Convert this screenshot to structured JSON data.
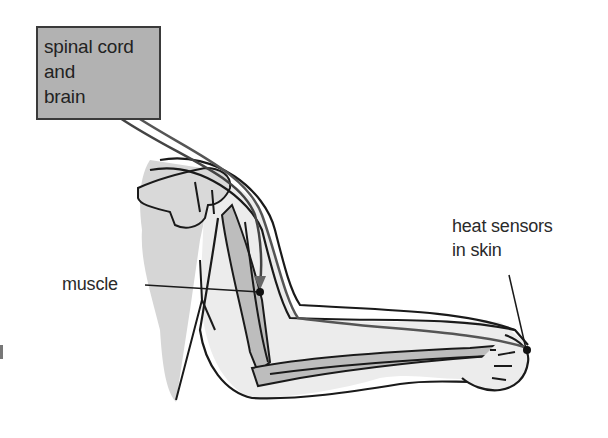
{
  "diagram": {
    "type": "reflex arc",
    "labels": {
      "brain_box": "spinal cord\nand\nbrain",
      "muscle": "muscle",
      "sensor": "heat sensors\nin skin"
    },
    "colors": {
      "box_fill": "#b2b2b2",
      "outline": "#1a1a1a",
      "skin_fill": "#e9e9e9",
      "bone_fill": "#bdbdbd",
      "torso_fill": "#d3d3d3",
      "nerve_arrow": "#555555"
    }
  }
}
